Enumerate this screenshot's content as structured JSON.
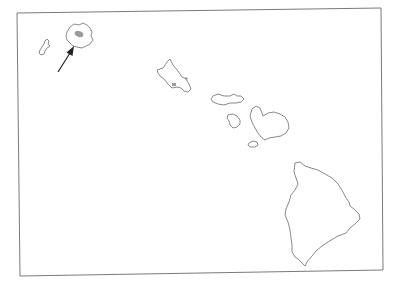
{
  "map": {
    "title": "Hawaiian Islands",
    "frame_color": "#7a7a7a",
    "outline_color": "#8a8a8a",
    "highlight_color": "#9a9a9a",
    "arrow_color": "#222222",
    "islands": [
      {
        "name": "Niihau"
      },
      {
        "name": "Kauai",
        "highlighted": true
      },
      {
        "name": "Oahu"
      },
      {
        "name": "Molokai"
      },
      {
        "name": "Lanai"
      },
      {
        "name": "Maui"
      },
      {
        "name": "Kahoolawe"
      },
      {
        "name": "Hawaii"
      }
    ],
    "annotation": {
      "type": "arrow",
      "points_to": "Kauai highlighted region"
    }
  }
}
